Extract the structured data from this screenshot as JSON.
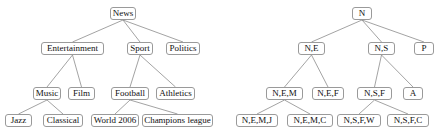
{
  "diagram": {
    "background_color": "#ffffff",
    "node_border_color": "#9a9a9a",
    "edge_color": "#8c8c8c",
    "text_color": "#101010",
    "trees": [
      {
        "id": "left-tree",
        "name": "news-topic-tree",
        "nodes": [
          {
            "id": "news",
            "label": "News",
            "x": 110,
            "y": 7,
            "w": 26,
            "level": 0
          },
          {
            "id": "entertainment",
            "label": "Entertainment",
            "x": 41,
            "y": 42,
            "w": 63,
            "level": 1
          },
          {
            "id": "sport",
            "label": "Sport",
            "x": 127,
            "y": 42,
            "w": 26,
            "level": 1
          },
          {
            "id": "politics",
            "label": "Politics",
            "x": 166,
            "y": 42,
            "w": 34,
            "level": 1
          },
          {
            "id": "music",
            "label": "Music",
            "x": 33,
            "y": 87,
            "w": 28,
            "level": 2
          },
          {
            "id": "film",
            "label": "Film",
            "x": 68,
            "y": 87,
            "w": 27,
            "level": 2
          },
          {
            "id": "football",
            "label": "Football",
            "x": 111,
            "y": 87,
            "w": 38,
            "level": 2
          },
          {
            "id": "athletics",
            "label": "Athletics",
            "x": 156,
            "y": 87,
            "w": 39,
            "level": 2
          },
          {
            "id": "jazz",
            "label": "Jazz",
            "x": 5,
            "y": 114,
            "w": 27,
            "level": 3
          },
          {
            "id": "classical",
            "label": "Classical",
            "x": 43,
            "y": 114,
            "w": 40,
            "level": 3
          },
          {
            "id": "world2006",
            "label": "World 2006",
            "x": 91,
            "y": 114,
            "w": 48,
            "level": 3
          },
          {
            "id": "champions",
            "label": "Champions league",
            "x": 142,
            "y": 114,
            "w": 71,
            "level": 3
          }
        ],
        "edges": [
          {
            "from": "news",
            "to": "entertainment"
          },
          {
            "from": "news",
            "to": "sport"
          },
          {
            "from": "news",
            "to": "politics"
          },
          {
            "from": "entertainment",
            "to": "music"
          },
          {
            "from": "entertainment",
            "to": "film"
          },
          {
            "from": "sport",
            "to": "football"
          },
          {
            "from": "sport",
            "to": "athletics"
          },
          {
            "from": "music",
            "to": "jazz"
          },
          {
            "from": "music",
            "to": "classical"
          },
          {
            "from": "football",
            "to": "world2006"
          },
          {
            "from": "football",
            "to": "champions"
          }
        ]
      },
      {
        "id": "right-tree",
        "name": "abbreviated-label-tree",
        "nodes": [
          {
            "id": "n",
            "label": "N",
            "x": 352,
            "y": 7,
            "w": 20,
            "level": 0
          },
          {
            "id": "ne",
            "label": "N,E",
            "x": 298,
            "y": 42,
            "w": 27,
            "level": 1
          },
          {
            "id": "ns",
            "label": "N,S",
            "x": 368,
            "y": 42,
            "w": 27,
            "level": 1
          },
          {
            "id": "p",
            "label": "P",
            "x": 414,
            "y": 42,
            "w": 20,
            "level": 1
          },
          {
            "id": "nem",
            "label": "N,E,M",
            "x": 266,
            "y": 87,
            "w": 37,
            "level": 2
          },
          {
            "id": "nef",
            "label": "N,E,F",
            "x": 312,
            "y": 87,
            "w": 32,
            "level": 2
          },
          {
            "id": "nsf",
            "label": "N,S,F",
            "x": 357,
            "y": 87,
            "w": 35,
            "level": 2
          },
          {
            "id": "a",
            "label": "A",
            "x": 403,
            "y": 87,
            "w": 20,
            "level": 2
          },
          {
            "id": "nemj",
            "label": "N,E,M,J",
            "x": 236,
            "y": 114,
            "w": 42,
            "level": 3
          },
          {
            "id": "nemc",
            "label": "N,E,M,C",
            "x": 287,
            "y": 114,
            "w": 46,
            "level": 3
          },
          {
            "id": "nsfw",
            "label": "N,S,F,W",
            "x": 337,
            "y": 114,
            "w": 44,
            "level": 3
          },
          {
            "id": "nsfc",
            "label": "N,S,F,C",
            "x": 387,
            "y": 114,
            "w": 42,
            "level": 3
          }
        ],
        "edges": [
          {
            "from": "n",
            "to": "ne"
          },
          {
            "from": "n",
            "to": "ns"
          },
          {
            "from": "n",
            "to": "p"
          },
          {
            "from": "ne",
            "to": "nem"
          },
          {
            "from": "ne",
            "to": "nef"
          },
          {
            "from": "ns",
            "to": "nsf"
          },
          {
            "from": "ns",
            "to": "a"
          },
          {
            "from": "nem",
            "to": "nemj"
          },
          {
            "from": "nem",
            "to": "nemc"
          },
          {
            "from": "nsf",
            "to": "nsfw"
          },
          {
            "from": "nsf",
            "to": "nsfc"
          }
        ]
      }
    ]
  }
}
